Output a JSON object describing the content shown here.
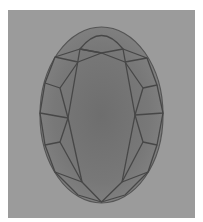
{
  "image": {
    "subject": "oval cut gemstone, top view facet diagram",
    "alt": "Oval faceted gemstone on gray background"
  },
  "colors": {
    "background": "#9b9b9b",
    "gem_fill": "#7a7a7a",
    "gem_center": "#6e6e6e",
    "facet_line": "#474747"
  }
}
